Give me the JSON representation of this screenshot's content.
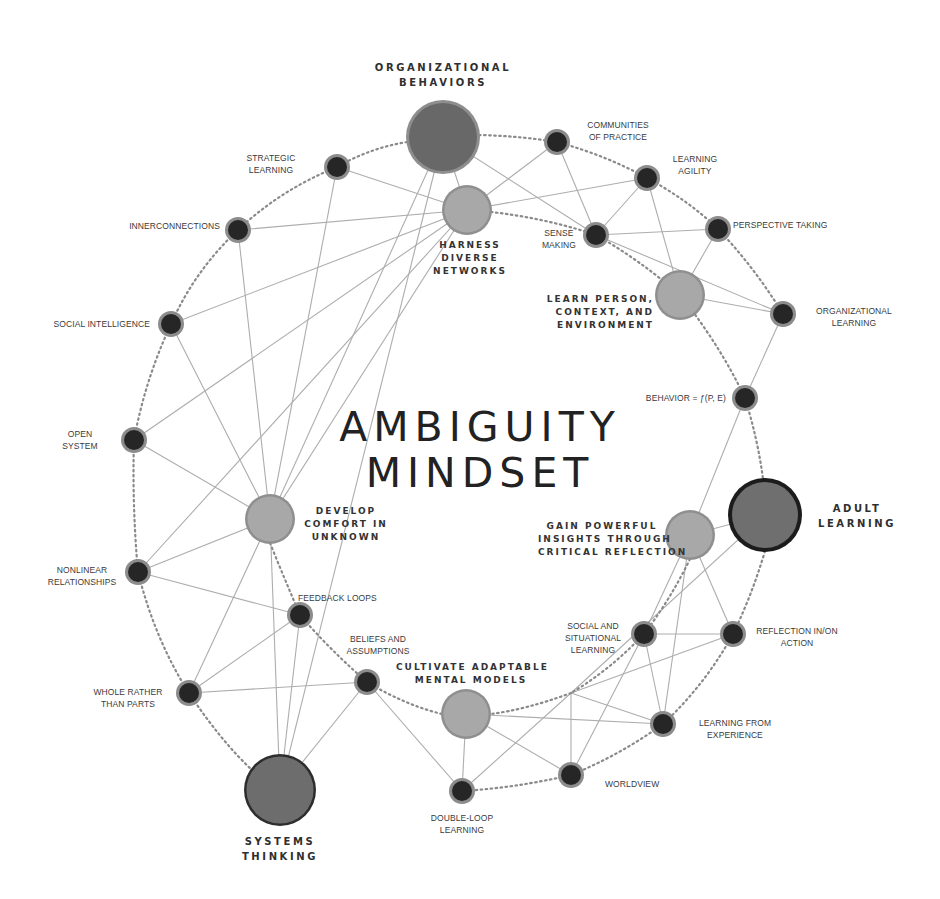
{
  "title": {
    "line1": "AMBIGUITY",
    "line2": "MINDSET"
  },
  "colors": {
    "background": "#ffffff",
    "edge": "#a8a8a8",
    "dotted_ring": "#8a8a8a",
    "major_node_fill": "#6b6b6b",
    "major_node_ring": "#8d8d8d",
    "medium_node_fill": "#a6a6a6",
    "medium_node_ring": "#8f8f8f",
    "minor_node_fill": "#2a2a2a",
    "minor_node_ring": "#8c8c8c",
    "adult_learning_ring": "#1c1c1c",
    "text": "#333333"
  },
  "nodes": {
    "organizational_behaviors": {
      "label_1": "ORGANIZATIONAL",
      "label_2": "BEHAVIORS",
      "type": "major"
    },
    "systems_thinking": {
      "label_1": "SYSTEMS",
      "label_2": "THINKING",
      "type": "major"
    },
    "adult_learning": {
      "label_1": "ADULT",
      "label_2": "LEARNING",
      "type": "major"
    },
    "harness_diverse_networks": {
      "label_1": "HARNESS",
      "label_2": "DIVERSE",
      "label_3": "NETWORKS",
      "type": "medium"
    },
    "learn_person_context_environment": {
      "label_1": "LEARN PERSON,",
      "label_2": "CONTEXT, AND",
      "label_3": "ENVIRONMENT",
      "type": "medium"
    },
    "develop_comfort_in_unknown": {
      "label_1": "DEVELOP",
      "label_2": "COMFORT IN",
      "label_3": "UNKNOWN",
      "type": "medium"
    },
    "gain_powerful_insights": {
      "label_1": "GAIN POWERFUL",
      "label_2": "INSIGHTS THROUGH",
      "label_3": "CRITICAL REFLECTION",
      "type": "medium"
    },
    "cultivate_adaptable_mental_models": {
      "label_1": "CULTIVATE ADAPTABLE",
      "label_2": "MENTAL MODELS",
      "type": "medium"
    },
    "strategic_learning": {
      "label_1": "STRATEGIC",
      "label_2": "LEARNING",
      "type": "minor"
    },
    "innerconnections": {
      "label_1": "INNERCONNECTIONS",
      "type": "minor"
    },
    "social_intelligence": {
      "label_1": "SOCIAL INTELLIGENCE",
      "type": "minor"
    },
    "open_system": {
      "label_1": "OPEN",
      "label_2": "SYSTEM",
      "type": "minor"
    },
    "nonlinear_relationships": {
      "label_1": "NONLINEAR",
      "label_2": "RELATIONSHIPS",
      "type": "minor"
    },
    "whole_rather_than_parts": {
      "label_1": "WHOLE RATHER",
      "label_2": "THAN PARTS",
      "type": "minor"
    },
    "feedback_loops": {
      "label_1": "FEEDBACK LOOPS",
      "type": "minor"
    },
    "beliefs_and_assumptions": {
      "label_1": "BELIEFS AND",
      "label_2": "ASSUMPTIONS",
      "type": "minor"
    },
    "double_loop_learning": {
      "label_1": "DOUBLE-LOOP",
      "label_2": "LEARNING",
      "type": "minor"
    },
    "worldview": {
      "label_1": "WORLDVIEW",
      "type": "minor"
    },
    "learning_from_experience": {
      "label_1": "LEARNING FROM",
      "label_2": "EXPERIENCE",
      "type": "minor"
    },
    "social_and_situational_learning": {
      "label_1": "SOCIAL AND",
      "label_2": "SITUATIONAL",
      "label_3": "LEARNING",
      "type": "minor"
    },
    "reflection_in_on_action": {
      "label_1": "REFLECTION IN/ON",
      "label_2": "ACTION",
      "type": "minor"
    },
    "behavior_function": {
      "label_1": "BEHAVIOR = ƒ(P, E)",
      "type": "minor"
    },
    "organizational_learning": {
      "label_1": "ORGANIZATIONAL",
      "label_2": "LEARNING",
      "type": "minor"
    },
    "perspective_taking": {
      "label_1": "PERSPECTIVE TAKING",
      "type": "minor"
    },
    "sense_making": {
      "label_1": "SENSE",
      "label_2": "MAKING",
      "type": "minor"
    },
    "learning_agility": {
      "label_1": "LEARNING",
      "label_2": "AGILITY",
      "type": "minor"
    },
    "communities_of_practice": {
      "label_1": "COMMUNITIES",
      "label_2": "OF PRACTICE",
      "type": "minor"
    }
  }
}
